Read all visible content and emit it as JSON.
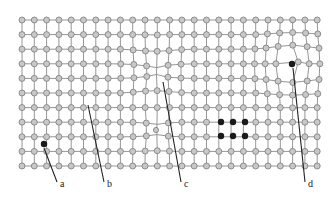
{
  "figure": {
    "width": 336,
    "height": 201,
    "colors": {
      "atom_fill": "#c8c8c8",
      "atom_stroke": "#7a7a7a",
      "bond": "#8a8a8a",
      "defect_atom": "#1a1a1a",
      "leader": "#222222"
    },
    "grid": {
      "rows": 11,
      "cols": 25,
      "x0": 22,
      "dx": 12.3,
      "y0": 20,
      "dy": 14.6
    },
    "defects": {
      "interstitial": {
        "x": 44,
        "y": 144
      },
      "substitutional_large": {
        "x": 292,
        "y": 64
      },
      "cluster": [
        {
          "x": 221,
          "y": 122
        },
        {
          "x": 233,
          "y": 122
        },
        {
          "x": 245,
          "y": 122
        },
        {
          "x": 221,
          "y": 136
        },
        {
          "x": 233,
          "y": 136
        },
        {
          "x": 245,
          "y": 136
        }
      ],
      "vacancy_site": {
        "x": 155,
        "y": 72
      },
      "small_substitutional": {
        "x": 156,
        "y": 130
      }
    },
    "labels": [
      {
        "text": "a",
        "x": 60,
        "y": 187,
        "lx1": 44,
        "ly1": 148,
        "lx2": 57,
        "ly2": 182
      },
      {
        "text": "b",
        "x": 107,
        "y": 187,
        "lx1": 88,
        "ly1": 105,
        "lx2": 104,
        "ly2": 182
      },
      {
        "text": "c",
        "x": 184,
        "y": 187,
        "lx1": 163,
        "ly1": 82,
        "lx2": 181,
        "ly2": 182
      },
      {
        "text": "d",
        "x": 308,
        "y": 187,
        "lx1": 293,
        "ly1": 68,
        "lx2": 305,
        "ly2": 182
      }
    ]
  }
}
